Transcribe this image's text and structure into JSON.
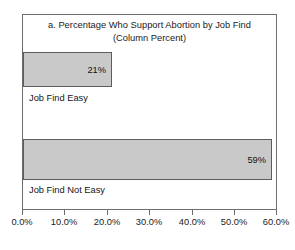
{
  "chart_data": {
    "type": "bar",
    "orientation": "horizontal",
    "title": "a. Percentage Who Support Abortion by Job Find",
    "subtitle": "(Column Percent)",
    "xlabel": "",
    "ylabel": "",
    "categories": [
      "Job Find Easy",
      "Job Find Not Easy"
    ],
    "values": [
      21,
      59
    ],
    "value_labels": [
      "21%",
      "59%"
    ],
    "xlim": [
      0,
      60
    ],
    "xticks": [
      0,
      10,
      20,
      30,
      40,
      50,
      60
    ],
    "xtick_labels": [
      "0.0%",
      "10.0%",
      "20.0%",
      "30.0%",
      "40.0%",
      "50.0%",
      "60.0%"
    ],
    "grid": false,
    "legend": false,
    "bar_fill_color": "#c9c9c9",
    "bar_border_color": "#5d5d5d",
    "frame_color": "#6d6d6d",
    "text_color": "#1a1a1a",
    "background_color": "#ffffff"
  }
}
